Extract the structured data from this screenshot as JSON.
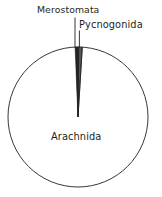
{
  "chart_data": {
    "type": "pie",
    "title": "",
    "subtitle": "",
    "xlabel": "",
    "ylabel": "",
    "legend_position": "none",
    "grid": false,
    "labels": [
      "Arachnida",
      "Merostomata",
      "Pycnogonida"
    ],
    "values": [
      98.4,
      0.8,
      0.8
    ],
    "slices": [
      {
        "label": "Arachnida",
        "value": 98.4,
        "label_placement": "inside",
        "start_angle_deg": 3.5,
        "end_angle_deg": 357.6,
        "fill": "#ffffff",
        "stroke": "#231f20"
      },
      {
        "label": "Merostomata",
        "value": 0.8,
        "label_placement": "outside-left",
        "start_angle_deg": 357.6,
        "end_angle_deg": 0.4,
        "fill": "#ffffff",
        "stroke": "#231f20"
      },
      {
        "label": "Pycnogonida",
        "value": 0.8,
        "label_placement": "outside-right",
        "start_angle_deg": 0.4,
        "end_angle_deg": 3.5,
        "fill": "#ffffff",
        "stroke": "#231f20"
      }
    ],
    "annotations": [
      {
        "name": "merostomata-leader",
        "text": "Merostomata"
      },
      {
        "name": "pycnogonida-leader",
        "text": "Pycnogonida"
      }
    ]
  },
  "figure": {
    "background": "#ffffff",
    "line_color": "#231f20",
    "line_width": 0.9,
    "circle": {
      "cx": 78,
      "cy": 117,
      "r": 70
    }
  },
  "labels": {
    "merostomata": "Merostomata",
    "pycnogonida": "Pycnogonida",
    "arachnida": "Arachnida"
  }
}
